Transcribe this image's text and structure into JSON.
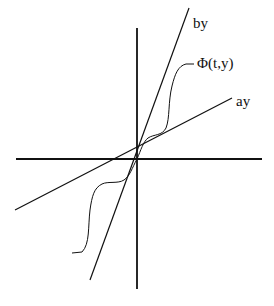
{
  "diagram": {
    "labels": {
      "upper_line": "by",
      "lower_line": "ay",
      "curve": "Φ(t,y)"
    },
    "colors": {
      "ink": "#111111",
      "background": "#ffffff"
    }
  }
}
